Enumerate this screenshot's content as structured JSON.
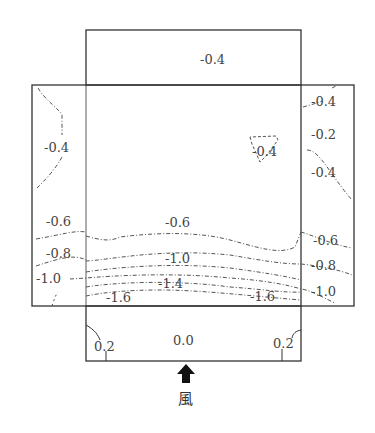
{
  "diagram": {
    "type": "wind pressure coefficient contour map (building plan)",
    "roof_label": "-0.4",
    "left_wall_labels": [
      "-0.4",
      "-0.6",
      "-0.8",
      "-1.0"
    ],
    "right_wall_labels": [
      "-0.4",
      "-0.2",
      "-0.4",
      "-0.6",
      "-0.8",
      "-1.0"
    ],
    "center_labels": [
      "-0.4",
      "-0.6",
      "-1.0",
      "-1.4",
      "-1.6",
      "-1.6"
    ],
    "windward_labels": [
      "0.2",
      "0.0",
      "0.2"
    ],
    "wind_label": "風",
    "wind_direction": "up"
  }
}
